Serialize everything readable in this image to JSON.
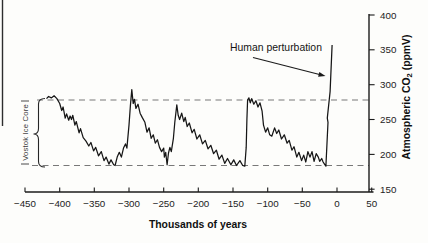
{
  "chart_data": {
    "type": "line",
    "title": "",
    "xlabel": "Thousands of years",
    "ylabel": "Atmospheric CO2 (ppmV)",
    "ylabel_parts": {
      "prefix": "Atmospheric CO",
      "sub": "2",
      "suffix": "(ppmV)"
    },
    "xlim": [
      -450,
      50
    ],
    "ylim": [
      150,
      400
    ],
    "x_ticks": [
      -450,
      -400,
      -350,
      -300,
      -250,
      -200,
      -150,
      -100,
      -50,
      0,
      50
    ],
    "y_ticks": [
      400,
      350,
      300,
      250,
      200,
      150
    ],
    "grid": false,
    "legend": "none",
    "bracket_label": "Vostok Ice Core",
    "reference_lines_ppm": [
      278,
      184
    ],
    "annotation": {
      "text": "Human perturbation",
      "points_to": {
        "x_kyr": -15,
        "co2_ppm": 310
      }
    },
    "series": [
      {
        "name": "Vostok Ice Core CO2 (ppmV)",
        "points": [
          [
            -419,
            280
          ],
          [
            -416,
            283
          ],
          [
            -412,
            281
          ],
          [
            -408,
            284
          ],
          [
            -404,
            280
          ],
          [
            -400,
            273
          ],
          [
            -397,
            263
          ],
          [
            -395,
            268
          ],
          [
            -392,
            252
          ],
          [
            -390,
            258
          ],
          [
            -387,
            249
          ],
          [
            -385,
            255
          ],
          [
            -383,
            250
          ],
          [
            -381,
            256
          ],
          [
            -378,
            242
          ],
          [
            -376,
            247
          ],
          [
            -372,
            231
          ],
          [
            -370,
            237
          ],
          [
            -366,
            224
          ],
          [
            -362,
            219
          ],
          [
            -358,
            212
          ],
          [
            -355,
            217
          ],
          [
            -351,
            205
          ],
          [
            -348,
            210
          ],
          [
            -344,
            198
          ],
          [
            -340,
            204
          ],
          [
            -336,
            191
          ],
          [
            -333,
            196
          ],
          [
            -329,
            186
          ],
          [
            -326,
            192
          ],
          [
            -322,
            185
          ],
          [
            -320,
            184
          ],
          [
            -317,
            196
          ],
          [
            -314,
            203
          ],
          [
            -311,
            196
          ],
          [
            -308,
            209
          ],
          [
            -305,
            215
          ],
          [
            -303,
            209
          ],
          [
            -300,
            242
          ],
          [
            -298,
            270
          ],
          [
            -296,
            293
          ],
          [
            -294,
            273
          ],
          [
            -292,
            279
          ],
          [
            -290,
            266
          ],
          [
            -287,
            272
          ],
          [
            -284,
            259
          ],
          [
            -281,
            253
          ],
          [
            -277,
            246
          ],
          [
            -274,
            232
          ],
          [
            -271,
            238
          ],
          [
            -268,
            223
          ],
          [
            -265,
            228
          ],
          [
            -262,
            216
          ],
          [
            -259,
            221
          ],
          [
            -256,
            210
          ],
          [
            -253,
            204
          ],
          [
            -250,
            209
          ],
          [
            -249,
            196
          ],
          [
            -247,
            203
          ],
          [
            -245,
            185
          ],
          [
            -243,
            202
          ],
          [
            -241,
            210
          ],
          [
            -239,
            204
          ],
          [
            -236,
            223
          ],
          [
            -234,
            246
          ],
          [
            -231,
            271
          ],
          [
            -229,
            256
          ],
          [
            -227,
            250
          ],
          [
            -224,
            259
          ],
          [
            -221,
            247
          ],
          [
            -219,
            253
          ],
          [
            -216,
            240
          ],
          [
            -213,
            245
          ],
          [
            -209,
            231
          ],
          [
            -206,
            236
          ],
          [
            -202,
            222
          ],
          [
            -198,
            228
          ],
          [
            -194,
            215
          ],
          [
            -190,
            220
          ],
          [
            -186,
            208
          ],
          [
            -182,
            213
          ],
          [
            -178,
            201
          ],
          [
            -174,
            206
          ],
          [
            -170,
            193
          ],
          [
            -166,
            199
          ],
          [
            -162,
            187
          ],
          [
            -158,
            194
          ],
          [
            -153,
            185
          ],
          [
            -149,
            192
          ],
          [
            -145,
            184
          ],
          [
            -140,
            191
          ],
          [
            -136,
            184
          ],
          [
            -133,
            183
          ],
          [
            -131,
            210
          ],
          [
            -130,
            250
          ],
          [
            -129,
            278
          ],
          [
            -127,
            281
          ],
          [
            -125,
            274
          ],
          [
            -123,
            280
          ],
          [
            -120,
            272
          ],
          [
            -117,
            277
          ],
          [
            -114,
            268
          ],
          [
            -111,
            274
          ],
          [
            -108,
            262
          ],
          [
            -106,
            242
          ],
          [
            -103,
            232
          ],
          [
            -100,
            238
          ],
          [
            -97,
            228
          ],
          [
            -94,
            226
          ],
          [
            -90,
            238
          ],
          [
            -87,
            230
          ],
          [
            -84,
            235
          ],
          [
            -80,
            222
          ],
          [
            -76,
            228
          ],
          [
            -72,
            216
          ],
          [
            -69,
            220
          ],
          [
            -65,
            206
          ],
          [
            -62,
            211
          ],
          [
            -58,
            196
          ],
          [
            -55,
            203
          ],
          [
            -51,
            191
          ],
          [
            -48,
            199
          ],
          [
            -45,
            189
          ],
          [
            -42,
            204
          ],
          [
            -39,
            196
          ],
          [
            -36,
            204
          ],
          [
            -33,
            190
          ],
          [
            -30,
            201
          ],
          [
            -27,
            196
          ],
          [
            -25,
            190
          ],
          [
            -22,
            194
          ],
          [
            -20,
            189
          ],
          [
            -18,
            186
          ],
          [
            -16,
            183
          ],
          [
            -13,
            246
          ],
          [
            -14,
            252
          ],
          [
            -10,
            290
          ],
          [
            -7,
            357
          ]
        ]
      }
    ]
  },
  "colors": {
    "ink": "#1b1b1b",
    "dash_gray": "#787878",
    "background": "#fdfdfb"
  }
}
